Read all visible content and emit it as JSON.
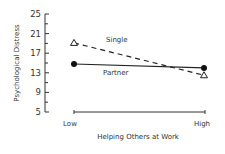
{
  "chart_data": {
    "type": "line",
    "title": "",
    "xlabel": "Helping Others at Work",
    "ylabel": "Psychological Distress",
    "categories": [
      "Low",
      "High"
    ],
    "ylim": [
      5,
      25
    ],
    "yticks": [
      5,
      9,
      13,
      17,
      21,
      25
    ],
    "yticks_labels": [
      "5",
      "9",
      "13",
      "17",
      "21",
      "25"
    ],
    "grid": false,
    "series": [
      {
        "name": "Single",
        "values": [
          19.1,
          12.5
        ],
        "marker": "open-triangle",
        "line": "dashed"
      },
      {
        "name": "Partner",
        "values": [
          14.8,
          14.0
        ],
        "marker": "filled-circle",
        "line": "solid"
      }
    ],
    "annotations": [
      {
        "text": "Single",
        "near": "dashed line, above"
      },
      {
        "text": "Partner",
        "near": "solid line, below"
      }
    ]
  }
}
